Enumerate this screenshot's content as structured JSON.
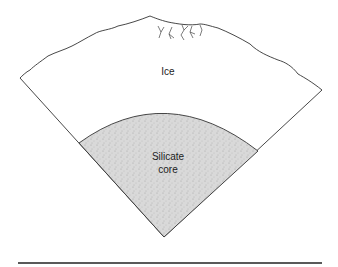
{
  "diagram": {
    "labels": {
      "ice": "Ice",
      "core_line1": "Silicate",
      "core_line2": "core"
    },
    "colors": {
      "stroke": "#333333",
      "core_fill": "#d6d6d6",
      "background": "#ffffff"
    }
  }
}
